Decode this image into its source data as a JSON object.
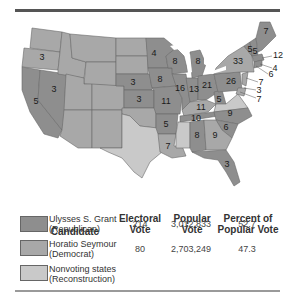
{
  "colors": {
    "republican": "#8e8e8e",
    "democrat": "#a8a8a8",
    "nonvoting": "#c9c9c9",
    "rule_top": "#555555",
    "rule_bottom": "#9a9a9a"
  },
  "map": {
    "electoral_votes": {
      "oregon": "3",
      "california": "5",
      "nevada": "3",
      "nebraska": "3",
      "kansas": "3",
      "minnesota": "4",
      "iowa": "8",
      "missouri": "11",
      "arkansas": "5",
      "louisiana": "7",
      "wisconsin": "8",
      "michigan": "8",
      "illinois": "16",
      "indiana": "13",
      "ohio": "21",
      "kentucky": "11",
      "west_virginia": "5",
      "tennessee": "10",
      "north_carolina": "9",
      "south_carolina": "6",
      "georgia": "9",
      "alabama": "8",
      "florida": "3",
      "pennsylvania": "26",
      "new_york": "33",
      "maine": "7",
      "new_hampshire": "5",
      "vermont": "5",
      "massachusetts": "12",
      "rhode_island": "4",
      "connecticut": "6",
      "new_jersey": "7",
      "delaware": "3",
      "maryland": "7"
    }
  },
  "table": {
    "headers": {
      "candidate": "Candidate",
      "electoral_1": "Electoral",
      "electoral_2": "Vote",
      "popular_1": "Popular",
      "popular_2": "Vote",
      "percent_1": "Percent of",
      "percent_2": "Popular Vote"
    },
    "rows": [
      {
        "name": "Ulysses S. Grant",
        "party": "(Republican)",
        "electoral": "214",
        "popular": "3,012,833",
        "percent": "52.7"
      },
      {
        "name": "Horatio Seymour",
        "party": "(Democrat)",
        "electoral": "80",
        "popular": "2,703,249",
        "percent": "47.3"
      },
      {
        "name": "Nonvoting states",
        "party": "(Reconstruction)",
        "electoral": "",
        "popular": "",
        "percent": ""
      }
    ]
  }
}
